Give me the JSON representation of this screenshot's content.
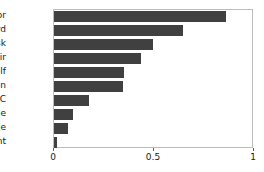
{
  "chart_data": {
    "type": "bar",
    "orientation": "horizontal",
    "title": "",
    "xlabel": "",
    "ylabel": "",
    "xlim": [
      0,
      1
    ],
    "xticks": [
      "0",
      "0.5",
      "1"
    ],
    "xtick_values": [
      0,
      0.5,
      1
    ],
    "grid": false,
    "legend": null,
    "bar_color": "#404040",
    "axis_color": "#bdbdbd",
    "categories": [
      "monitor",
      "keyboard",
      "desk",
      "chair",
      "bookshelf",
      "trash bin",
      "PC",
      "phone",
      "table",
      "plant"
    ],
    "values": [
      0.86,
      0.645,
      0.495,
      0.435,
      0.35,
      0.345,
      0.175,
      0.095,
      0.07,
      0.015
    ]
  }
}
